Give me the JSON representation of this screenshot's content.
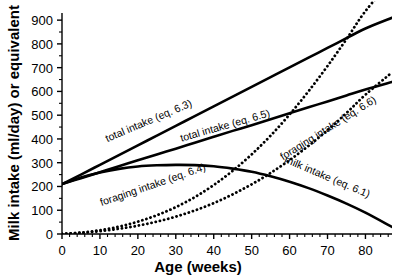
{
  "chart_data": {
    "type": "line",
    "title": "",
    "xlabel": "Age (weeks)",
    "ylabel": "Milk intake (ml/day) or equivalent",
    "xlim": [
      0,
      87
    ],
    "ylim": [
      0,
      930
    ],
    "grid": false,
    "legend": "inline-curve-labels",
    "x_ticks": [
      0,
      10,
      20,
      30,
      40,
      50,
      60,
      70,
      80
    ],
    "x_tick_labels": [
      "0",
      "10",
      "20",
      "30",
      "40",
      "50",
      "60",
      "70",
      "80"
    ],
    "x_minor_step": 2,
    "y_ticks": [
      0,
      100,
      200,
      300,
      400,
      500,
      600,
      700,
      800,
      900
    ],
    "y_tick_labels": [
      "0",
      "100",
      "200",
      "300",
      "400",
      "500",
      "600",
      "700",
      "800",
      "900"
    ],
    "y_minor_step": 50,
    "x": [
      0,
      5,
      10,
      15,
      20,
      25,
      30,
      35,
      40,
      45,
      50,
      55,
      60,
      65,
      70,
      75,
      80,
      87
    ],
    "series": [
      {
        "name": "total intake (eq. 6.3)",
        "label": "total intake (eq. 6.3)",
        "style": "solid",
        "color": "#000000",
        "width": 2.6,
        "values": [
          210,
          250,
          291,
          332,
          373,
          414,
          455,
          496,
          537,
          578,
          619,
          660,
          701,
          742,
          783,
          824,
          865,
          910
        ]
      },
      {
        "name": "total intake (eq. 6.5)",
        "label": "total intake (eq. 6.5)",
        "style": "solid",
        "color": "#000000",
        "width": 2.6,
        "values": [
          210,
          235,
          260,
          285,
          310,
          335,
          359,
          384,
          409,
          434,
          458,
          483,
          508,
          533,
          558,
          583,
          608,
          640
        ]
      },
      {
        "name": "milk intake (eq. 6.1)",
        "label": "milk intake (eq. 6.1)",
        "style": "solid",
        "color": "#000000",
        "width": 2.6,
        "values": [
          210,
          238,
          259,
          274,
          284,
          289,
          291,
          290,
          285,
          275,
          262,
          243,
          220,
          193,
          162,
          128,
          90,
          30
        ]
      },
      {
        "name": "foraging intake (eq. 6.4)",
        "label": "foraging intake (eq. 6.4)",
        "style": "dotted",
        "color": "#000000",
        "width": 2.6,
        "values": [
          0,
          6,
          16,
          31,
          52,
          79,
          113,
          155,
          206,
          266,
          335,
          414,
          503,
          601,
          707,
          820,
          938,
          1070
        ]
      },
      {
        "name": "foraging intake (eq. 6.6)",
        "label": "foraging intake (eq. 6.6)",
        "style": "dotted",
        "color": "#000000",
        "width": 2.6,
        "values": [
          0,
          5,
          12,
          22,
          35,
          52,
          73,
          99,
          130,
          167,
          209,
          257,
          311,
          371,
          437,
          509,
          586,
          680
        ]
      }
    ],
    "curve_labels": [
      {
        "text": "total intake (eq. 6.3)",
        "x": 150,
        "y": 124,
        "rotate": -23
      },
      {
        "text": "total intake (eq. 6.5)",
        "x": 226,
        "y": 129,
        "rotate": -16
      },
      {
        "text": "foraging intake (eq. 6.6)",
        "x": 330,
        "y": 131,
        "rotate": -32
      },
      {
        "text": "foraging intake (eq. 6.4)",
        "x": 154,
        "y": 188,
        "rotate": -19
      },
      {
        "text": "milk intake (eq. 6.1)",
        "x": 326,
        "y": 180,
        "rotate": 23
      }
    ]
  }
}
